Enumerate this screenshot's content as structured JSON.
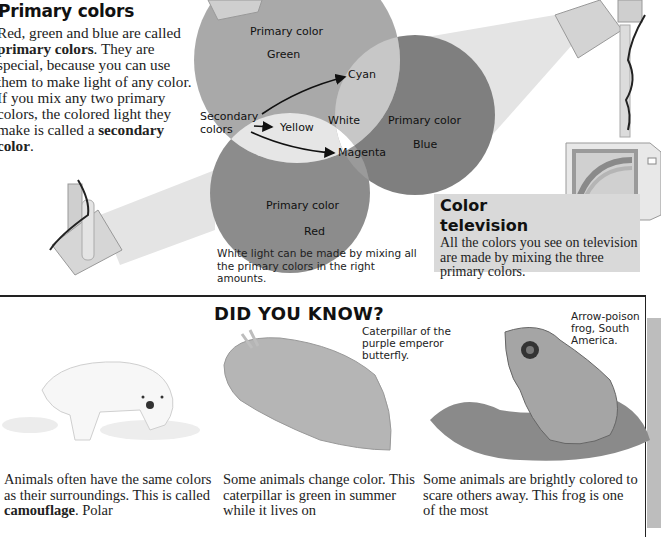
{
  "primary_colors": {
    "title": "Primary colors",
    "body_parts": [
      {
        "text": "Red, green and blue are called ",
        "bold": false
      },
      {
        "text": "primary colors",
        "bold": true
      },
      {
        "text": ". They are special, because you can use them to make light of any color. If you mix any two primary colors, the colored light they make is called a ",
        "bold": false
      },
      {
        "text": "secondary color",
        "bold": true
      },
      {
        "text": ".",
        "bold": false
      }
    ]
  },
  "venn": {
    "circles": [
      {
        "label": "Primary color",
        "name": "Green",
        "tone": "#a9a9a9"
      },
      {
        "label": "Primary color",
        "name": "Blue",
        "tone": "#7f7f7f"
      },
      {
        "label": "Primary color",
        "name": "Red",
        "tone": "#8c8c8c"
      }
    ],
    "overlaps": {
      "green_blue": "Cyan",
      "green_red": "Yellow",
      "red_blue": "Magenta",
      "center": "White"
    },
    "secondary_label": "Secondary colors",
    "caption": "White light can be made by mixing all the primary colors in the right amounts."
  },
  "color_tv": {
    "title_line1": "Color",
    "title_line2": "television",
    "body": "All the colors you see on television are made by mixing the three primary colors."
  },
  "did_you_know": {
    "title": "DID YOU KNOW?",
    "captions": {
      "caterpillar": "Caterpillar of the purple emperor butterfly.",
      "frog": "Arrow-poison frog, South America."
    },
    "stories": [
      {
        "parts": [
          {
            "text": "Animals often have the same colors as their surroundings. This is called ",
            "bold": false
          },
          {
            "text": "camouflage",
            "bold": true
          },
          {
            "text": ". Polar",
            "bold": false
          }
        ]
      },
      {
        "parts": [
          {
            "text": "Some animals change color. This caterpillar is green in summer while it lives on",
            "bold": false
          }
        ]
      },
      {
        "parts": [
          {
            "text": "Some animals are brightly colored to scare others away. This frog is one of the most",
            "bold": false
          }
        ]
      }
    ]
  }
}
